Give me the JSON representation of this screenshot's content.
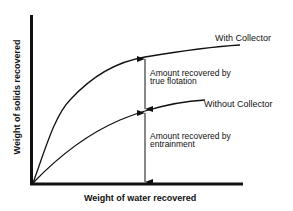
{
  "diagram": {
    "x_axis_label": "Weight of water recovered",
    "y_axis_label": "Weight of solids recovered",
    "curves": [
      {
        "name": "with-collector",
        "label": "With Collector"
      },
      {
        "name": "without-collector",
        "label": "Without Collector"
      }
    ],
    "annotations": [
      {
        "name": "true-flotation",
        "line1": "Amount recovered by",
        "line2": "true flotation"
      },
      {
        "name": "entrainment",
        "line1": "Amount recovered by",
        "line2": "entrainment"
      }
    ],
    "colors": {
      "ink": "#111111",
      "background": "#ffffff"
    }
  }
}
